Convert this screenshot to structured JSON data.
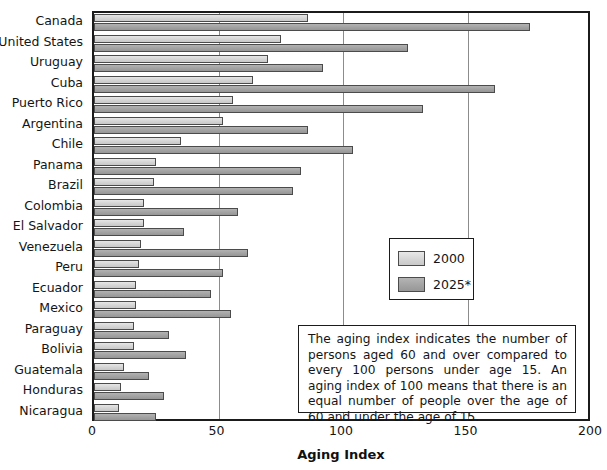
{
  "figure": {
    "clipped_title_fragment": "Aging",
    "xaxis_title": "Aging Index",
    "note": "The aging index indicates the number of persons aged 60 and over compared to every 100 persons under age 15. An aging index of 100 means that there is an equal number of people over the age of 60 and under the age of 15."
  },
  "legend": {
    "items": [
      {
        "label": "2000",
        "color": "#d4d4d4"
      },
      {
        "label": "2025*",
        "color": "#a2a2a2"
      }
    ]
  },
  "chart_data": {
    "type": "bar",
    "orientation": "horizontal",
    "title": "Aging Index",
    "xlabel": "Aging Index",
    "ylabel": "",
    "xlim": [
      0,
      200
    ],
    "xticks": [
      0,
      50,
      100,
      150,
      200
    ],
    "grid": true,
    "legend_position": "middle-right",
    "categories": [
      "Canada",
      "United States",
      "Uruguay",
      "Cuba",
      "Puerto Rico",
      "Argentina",
      "Chile",
      "Panama",
      "Brazil",
      "Colombia",
      "El Salvador",
      "Venezuela",
      "Peru",
      "Ecuador",
      "Mexico",
      "Paraguay",
      "Bolivia",
      "Guatemala",
      "Honduras",
      "Nicaragua"
    ],
    "series": [
      {
        "name": "2000",
        "color": "#d4d4d4",
        "values": [
          86,
          75,
          70,
          64,
          56,
          52,
          35,
          25,
          24,
          20,
          20,
          19,
          18,
          17,
          17,
          16,
          16,
          12,
          11,
          10
        ]
      },
      {
        "name": "2025*",
        "color": "#a2a2a2",
        "values": [
          175,
          126,
          92,
          161,
          132,
          86,
          104,
          83,
          80,
          58,
          36,
          62,
          52,
          47,
          55,
          30,
          37,
          22,
          28,
          25
        ]
      }
    ]
  }
}
